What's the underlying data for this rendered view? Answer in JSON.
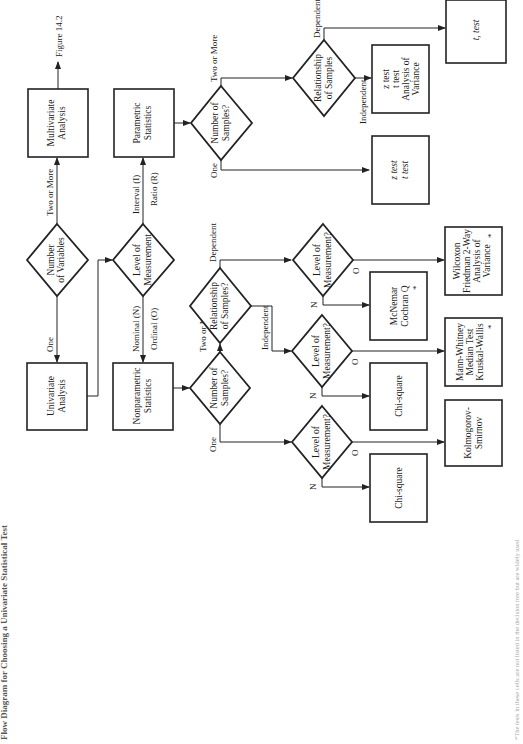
{
  "title": "Flow Diagram for Choosing a Univariate Statistical Test",
  "footnote": "*The tests in these cells are not listed in the decision tree but are widely used",
  "nodes": {
    "num_variables": [
      "Number",
      "of Variables"
    ],
    "univariate": [
      "Univariate",
      "Analysis"
    ],
    "multivariate": [
      "Multivariate",
      "Analysis"
    ],
    "figure_ref": "Figure 14.2",
    "level_measurement": [
      "Level of",
      "Measurement"
    ],
    "nonparametric": [
      "Nonparametric",
      "Statistics"
    ],
    "parametric": [
      "Parametric",
      "Statistics"
    ],
    "np_num_samples": [
      "Number of",
      "Samples?"
    ],
    "np_relationship": [
      "Relationship",
      "of Samples?"
    ],
    "np_lom_one": [
      "Level of",
      "Measurement?"
    ],
    "np_lom_indep": [
      "Level of",
      "Measurement?"
    ],
    "np_lom_dep": [
      "Level of",
      "Measurement?"
    ],
    "p_num_samples": [
      "Number of",
      "Samples?"
    ],
    "p_relationship": [
      "Relationship",
      "of Samples"
    ],
    "chi_square_1": [
      "Chi-square"
    ],
    "kolmogorov": [
      "Kolmogorov-",
      "Smirnov"
    ],
    "chi_square_2": [
      "Chi-square"
    ],
    "mann_whitney": [
      "Mann-Whitney",
      "Median Test",
      "Kruskal-Wallis"
    ],
    "mcnemar": [
      "McNemar",
      "Cochran Q"
    ],
    "wilcoxon": [
      "Wilcoxon",
      "Friedman 2-Way",
      "Analysis of",
      "Variance"
    ],
    "p_one_tests": [
      "z test",
      "t test"
    ],
    "p_indep_tests": [
      "z test",
      "t test",
      "Analysis of",
      "Variance"
    ],
    "p_dep_tests": [
      "t, test"
    ],
    "asterisk": "*"
  },
  "edge_labels": {
    "one": "One",
    "two_or_more": "Two or More",
    "nominal": "Nominal (N)",
    "ordinal": "Ordinal (O)",
    "interval": "Interval (I)",
    "ratio": "Ratio (R)",
    "independent": "Independent",
    "dependent": "Dependent",
    "n": "N",
    "o": "O"
  }
}
